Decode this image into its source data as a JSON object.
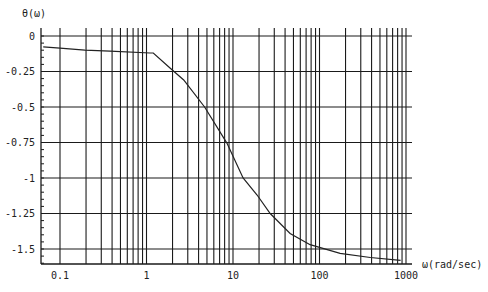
{
  "chart_data": {
    "type": "line",
    "title": "",
    "ylabel": "θ(ω)",
    "xlabel": "ω(rad/sec)",
    "xscale": "log",
    "xlim": [
      0.064,
      1100
    ],
    "ylim": [
      -1.6,
      0.05
    ],
    "grid": true,
    "legend": null,
    "x_ticks": [
      0.1,
      1,
      10,
      100,
      1000
    ],
    "x_tick_labels": [
      "0.1",
      "1",
      "10",
      "100",
      "1000"
    ],
    "y_ticks": [
      0,
      -0.25,
      -0.5,
      -0.75,
      -1,
      -1.25,
      -1.5
    ],
    "y_tick_labels": [
      "0",
      "-0.25",
      "-0.5",
      "-0.75",
      "-1",
      "-1.25",
      "-1.5"
    ],
    "series": [
      {
        "name": "θ(ω)",
        "x": [
          0.064,
          0.1,
          0.194,
          0.378,
          1.1,
          1.2,
          1.87,
          2.69,
          4.7,
          8.5,
          13.1,
          19.0,
          26.9,
          45.7,
          77.9,
          173,
          387,
          865
        ],
        "y": [
          -0.077,
          -0.085,
          -0.099,
          -0.106,
          -0.12,
          -0.12,
          -0.225,
          -0.31,
          -0.5,
          -0.754,
          -1.0,
          -1.12,
          -1.25,
          -1.39,
          -1.47,
          -1.53,
          -1.56,
          -1.58
        ]
      }
    ]
  },
  "colors": {
    "line": "#222222",
    "grid": "#1a1a1a",
    "background": "#ffffff"
  }
}
